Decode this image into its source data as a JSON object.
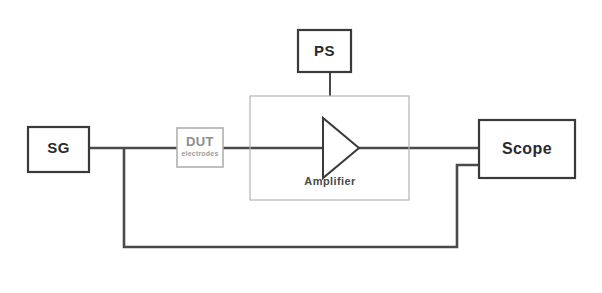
{
  "diagram": {
    "background_color": "#ffffff",
    "wire_color": "#4a4a4a",
    "box_border_color": "#3a3a3a",
    "faint_border_color": "#b5b5b5",
    "blocks": {
      "signal_generator": {
        "label": "SG",
        "name": "signal-generator"
      },
      "device_under_test": {
        "label": "DUT",
        "sublabel": "electrodes",
        "name": "device-under-test"
      },
      "power_supply": {
        "label": "PS",
        "name": "power-supply"
      },
      "amplifier": {
        "label": "Amplifier",
        "name": "amplifier"
      },
      "oscilloscope": {
        "label": "Scope",
        "name": "oscilloscope"
      }
    },
    "connections": [
      {
        "from": "SG",
        "to": "DUT",
        "type": "signal-line"
      },
      {
        "from": "DUT",
        "to": "Amplifier",
        "type": "signal-line"
      },
      {
        "from": "PS",
        "to": "Amplifier",
        "type": "power-line"
      },
      {
        "from": "Amplifier",
        "to": "Scope",
        "type": "signal-line"
      },
      {
        "from": "SG",
        "to": "Scope",
        "type": "return-line"
      }
    ]
  }
}
